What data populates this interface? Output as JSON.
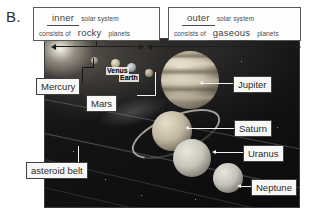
{
  "part": {
    "letter": "B."
  },
  "statements": {
    "left": {
      "blank1": "inner",
      "text1": "solar system",
      "text2": "consists of",
      "blank2": "rocky",
      "text3": "planets"
    },
    "right": {
      "blank1": "outer",
      "text1": "solar system",
      "text2": "consists of",
      "blank2": "gaseous",
      "text3": "planets"
    }
  },
  "photo": {
    "alt_name": "solar-system-photograph",
    "callouts": [
      {
        "name": "mercury",
        "label": "Mercury"
      },
      {
        "name": "mars",
        "label": "Mars"
      },
      {
        "name": "asteroid-belt",
        "label": "asteroid belt"
      },
      {
        "name": "jupiter",
        "label": "Jupiter"
      },
      {
        "name": "saturn",
        "label": "Saturn"
      },
      {
        "name": "uranus",
        "label": "Uranus"
      },
      {
        "name": "neptune",
        "label": "Neptune"
      }
    ],
    "inline_labels": [
      {
        "name": "venus",
        "label": "Venus"
      },
      {
        "name": "earth",
        "label": "Earth"
      }
    ]
  },
  "colors": {
    "box_border": "#5a5a5a",
    "callout_border": "#3f3f3f",
    "callout_bg": "#f7f7f5",
    "ink": "#2b2b2b",
    "arrow": "#1d1d1d"
  }
}
